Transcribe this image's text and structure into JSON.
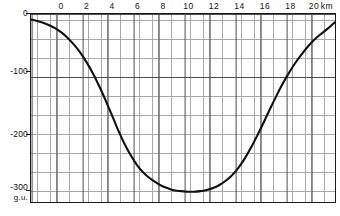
{
  "figure": {
    "name": "gravity-anomaly-profile",
    "background_color": "#fefefe",
    "frame_color": "#1a1a1a",
    "grid_minor_color": "#9a9a9a",
    "grid_major_color": "#4d4d4d",
    "curve_color": "#111111"
  },
  "axes": {
    "x_unit_label": "km",
    "y_unit_label": "g.u.",
    "x_ticks": [
      {
        "value": 0,
        "label": "0"
      },
      {
        "value": 2,
        "label": "2"
      },
      {
        "value": 4,
        "label": "4"
      },
      {
        "value": 6,
        "label": "6"
      },
      {
        "value": 8,
        "label": "8"
      },
      {
        "value": 10,
        "label": "10"
      },
      {
        "value": 12,
        "label": "12"
      },
      {
        "value": 14,
        "label": "14"
      },
      {
        "value": 16,
        "label": "16"
      },
      {
        "value": 18,
        "label": "18"
      },
      {
        "value": 20,
        "label": "20"
      }
    ],
    "y_ticks": [
      {
        "value": 0,
        "label": "0"
      },
      {
        "value": -100,
        "label": "-100"
      },
      {
        "value": -200,
        "label": "-200"
      },
      {
        "value": -300,
        "label": "-300"
      }
    ]
  },
  "chart_data": {
    "type": "line",
    "title": "",
    "subtitle": "",
    "xlabel": "km",
    "ylabel": "g.u.",
    "xlim": [
      -2.4,
      21.8
    ],
    "ylim": [
      -310,
      0
    ],
    "grid": true,
    "grid_minor_step_x": 0.5,
    "grid_minor_step_y": 10,
    "grid_major_step_x": 2,
    "grid_major_step_y": 100,
    "legend": null,
    "annotations": [],
    "series": [
      {
        "name": "Bouguer gravity anomaly",
        "x": [
          -2.4,
          -2.0,
          -1.5,
          -1.0,
          -0.5,
          0.0,
          0.5,
          1.0,
          1.5,
          2.0,
          2.5,
          3.0,
          3.5,
          4.0,
          4.5,
          5.0,
          5.5,
          6.0,
          6.5,
          7.0,
          7.5,
          8.0,
          8.5,
          9.0,
          9.5,
          10.0,
          10.5,
          11.0,
          11.5,
          12.0,
          12.5,
          13.0,
          13.5,
          14.0,
          14.5,
          15.0,
          15.5,
          16.0,
          16.5,
          17.0,
          17.5,
          18.0,
          18.5,
          19.0,
          19.5,
          20.0,
          20.5,
          21.0,
          21.5,
          21.8
        ],
        "y": [
          -9,
          -11,
          -14,
          -18,
          -23,
          -30,
          -39,
          -50,
          -63,
          -79,
          -97,
          -118,
          -141,
          -165,
          -190,
          -212,
          -231,
          -247,
          -259,
          -268,
          -275,
          -281,
          -285,
          -288,
          -289,
          -290,
          -290,
          -289,
          -287,
          -284,
          -279,
          -272,
          -263,
          -251,
          -236,
          -218,
          -198,
          -177,
          -155,
          -134,
          -114,
          -96,
          -80,
          -66,
          -53,
          -42,
          -33,
          -25,
          -16,
          -11
        ]
      }
    ]
  }
}
